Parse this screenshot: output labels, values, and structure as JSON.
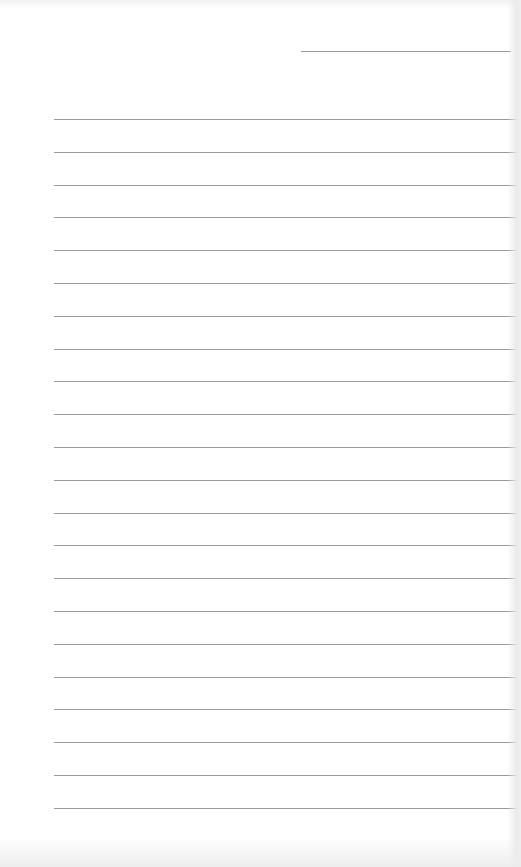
{
  "sheet": {
    "type": "lined-paper",
    "background": "#ffffff",
    "rule_color": "#8a8a8a",
    "header_line": {
      "x_start": 301,
      "x_end": 511,
      "y": 51
    },
    "rules": {
      "count": 22,
      "x_start": 54,
      "x_end": 516,
      "first_y": 119,
      "spacing": 32.8
    }
  }
}
